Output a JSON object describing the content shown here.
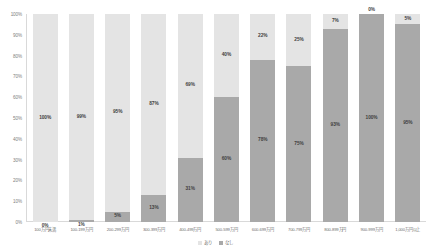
{
  "chart_data": {
    "type": "bar",
    "subtype": "100% stacked bar",
    "title": "",
    "xlabel": "",
    "ylabel": "",
    "ylim": [
      0,
      100
    ],
    "grid": false,
    "legend_position": "bottom-center",
    "categories": [
      "100万円未満",
      "100-199万円",
      "200-299万円",
      "300-399万円",
      "400-499万円",
      "500-599万円",
      "600-699万円",
      "700-799万円",
      "800-899万円",
      "900-999万円",
      "1,000万円以上"
    ],
    "series": [
      {
        "name": "あり",
        "color": "#e4e4e4",
        "values": [
          100,
          99,
          95,
          87,
          69,
          40,
          22,
          25,
          7,
          0,
          5
        ]
      },
      {
        "name": "なし",
        "color": "#a9a9a9",
        "values": [
          0,
          1,
          5,
          13,
          31,
          60,
          78,
          75,
          93,
          100,
          95
        ]
      }
    ],
    "ytick_labels": [
      "100%",
      "90%",
      "80%",
      "70%",
      "60%",
      "50%",
      "40%",
      "30%",
      "20%",
      "10%",
      "0%"
    ],
    "ytick_values": [
      100,
      90,
      80,
      70,
      60,
      50,
      40,
      30,
      20,
      10,
      0
    ],
    "data_labels": {
      "ari": [
        "100%",
        "99%",
        "95%",
        "87%",
        "69%",
        "40%",
        "22%",
        "25%",
        "7%",
        "0%",
        "5%"
      ],
      "nashi": [
        "0%",
        "1%",
        "5%",
        "13%",
        "31%",
        "60%",
        "78%",
        "75%",
        "93%",
        "100%",
        "95%"
      ]
    }
  },
  "legend": {
    "items": [
      {
        "label": "あり",
        "color": "#e4e4e4"
      },
      {
        "label": "なし",
        "color": "#a9a9a9"
      }
    ]
  }
}
